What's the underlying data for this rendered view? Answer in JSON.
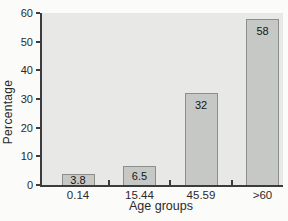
{
  "chart_data": {
    "type": "bar",
    "categories": [
      "0.14",
      "15.44",
      "45.59",
      ">60"
    ],
    "values": [
      3.8,
      6.5,
      32,
      58
    ],
    "bar_labels": [
      "3.8",
      "6.5",
      "32",
      "58"
    ],
    "title": "",
    "xlabel": "Age groups",
    "ylabel": "Percentage",
    "ylim": [
      0,
      60
    ],
    "yticks": [
      0,
      10,
      20,
      30,
      40,
      50,
      60
    ],
    "grid": false,
    "legend": null,
    "colors": {
      "page_bg": "#fbfbf9",
      "plot_bg": "#e8e9e6",
      "bar_fill": "#c6c8c5",
      "bar_border": "#8b8e8b",
      "axis": "#3c3c3c",
      "text": "#1c1c1c"
    }
  }
}
